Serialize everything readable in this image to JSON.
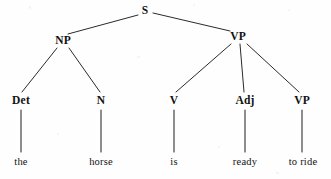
{
  "diagram": {
    "kind": "syntax-tree",
    "sentence": "the horse is ready to ride",
    "background_color": "#fefefe",
    "ink_color": "#111111",
    "edge_color": "#2b2b2b",
    "width": 331,
    "height": 179
  },
  "nodes": {
    "s": {
      "label": "S",
      "x": 145,
      "y": 11,
      "type": "nonterminal"
    },
    "np": {
      "label": "NP",
      "x": 63,
      "y": 41,
      "type": "nonterminal"
    },
    "vp_top": {
      "label": "VP",
      "x": 238,
      "y": 37,
      "type": "nonterminal"
    },
    "det": {
      "label": "Det",
      "x": 21,
      "y": 101,
      "type": "nonterminal"
    },
    "n": {
      "label": "N",
      "x": 101,
      "y": 101,
      "type": "nonterminal"
    },
    "v": {
      "label": "V",
      "x": 174,
      "y": 101,
      "type": "nonterminal"
    },
    "adj": {
      "label": "Adj",
      "x": 245,
      "y": 101,
      "type": "nonterminal"
    },
    "vp_low": {
      "label": "VP",
      "x": 302,
      "y": 101,
      "type": "nonterminal"
    },
    "word_the": {
      "label": "the",
      "x": 21,
      "y": 162,
      "type": "terminal"
    },
    "word_horse": {
      "label": "horse",
      "x": 101,
      "y": 162,
      "type": "terminal"
    },
    "word_is": {
      "label": "is",
      "x": 174,
      "y": 162,
      "type": "terminal"
    },
    "word_ready": {
      "label": "ready",
      "x": 245,
      "y": 162,
      "type": "terminal"
    },
    "word_to_ride": {
      "label": "to ride",
      "x": 303,
      "y": 162,
      "type": "terminal"
    }
  },
  "edges": [
    {
      "from": "s",
      "to": "np",
      "x1": 138,
      "y1": 15,
      "x2": 68,
      "y2": 34
    },
    {
      "from": "s",
      "to": "vp_top",
      "x1": 153,
      "y1": 13,
      "x2": 230,
      "y2": 31
    },
    {
      "from": "np",
      "to": "det",
      "x1": 57,
      "y1": 48,
      "x2": 22,
      "y2": 92
    },
    {
      "from": "np",
      "to": "n",
      "x1": 69,
      "y1": 48,
      "x2": 100,
      "y2": 92
    },
    {
      "from": "vp_top",
      "to": "v",
      "x1": 231,
      "y1": 44,
      "x2": 176,
      "y2": 92
    },
    {
      "from": "vp_top",
      "to": "adj",
      "x1": 240,
      "y1": 44,
      "x2": 244,
      "y2": 92
    },
    {
      "from": "vp_top",
      "to": "vp_low",
      "x1": 247,
      "y1": 44,
      "x2": 299,
      "y2": 92
    },
    {
      "from": "det",
      "to": "word_the",
      "x1": 21,
      "y1": 110,
      "x2": 21,
      "y2": 152
    },
    {
      "from": "n",
      "to": "word_horse",
      "x1": 101,
      "y1": 110,
      "x2": 101,
      "y2": 152
    },
    {
      "from": "v",
      "to": "word_is",
      "x1": 174,
      "y1": 110,
      "x2": 174,
      "y2": 152
    },
    {
      "from": "adj",
      "to": "word_ready",
      "x1": 245,
      "y1": 110,
      "x2": 245,
      "y2": 152
    },
    {
      "from": "vp_low",
      "to": "word_to_ride",
      "x1": 302,
      "y1": 110,
      "x2": 302,
      "y2": 152
    }
  ]
}
